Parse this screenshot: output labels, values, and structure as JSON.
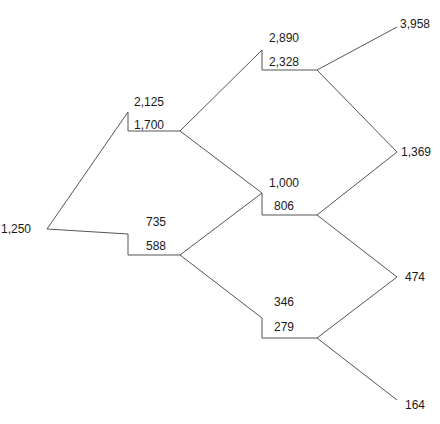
{
  "diagram": {
    "type": "binomial-tree",
    "root": {
      "value": "1,250"
    },
    "nodes": [
      {
        "id": "up",
        "upper": "2,125",
        "lower": "1,700"
      },
      {
        "id": "down",
        "upper": "735",
        "lower": "588"
      },
      {
        "id": "up-up",
        "upper": "2,890",
        "lower": "2,328"
      },
      {
        "id": "up-down",
        "upper": "1,000",
        "lower": "806"
      },
      {
        "id": "down-down",
        "upper": "346",
        "lower": "279"
      }
    ],
    "terminals": [
      "3,958",
      "1,369",
      "474",
      "164"
    ],
    "line_color": "#555555",
    "text_color": "#1a1a1a"
  }
}
